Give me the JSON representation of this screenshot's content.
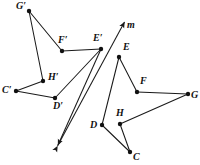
{
  "figure": {
    "type": "geometry-diagram",
    "width": 200,
    "height": 165,
    "background_color": "#ffffff",
    "stroke_color": "#1a1a1a",
    "point_color": "#111111"
  },
  "line_m": {
    "label": "m",
    "label_x": 127,
    "label_y": 20,
    "x1": 57.5,
    "y1": 146,
    "x2": 124.5,
    "y2": 22,
    "arrow_start": true,
    "arrow_end": true
  },
  "ray_ep": {
    "label": "",
    "x1": 101,
    "y1": 49,
    "x2": 58,
    "y2": 145,
    "arrow_end": true
  },
  "points": [
    {
      "id": "G-prime",
      "label": "G′",
      "x": 29,
      "y": 11,
      "label_x": 16,
      "label_y": 1,
      "dot": true
    },
    {
      "id": "F-prime",
      "label": "F′",
      "x": 62,
      "y": 51,
      "label_x": 58,
      "label_y": 35,
      "dot": true
    },
    {
      "id": "E-prime",
      "label": "E′",
      "x": 101,
      "y": 49,
      "label_x": 93,
      "label_y": 33,
      "dot": true
    },
    {
      "id": "H-prime",
      "label": "H′",
      "x": 43,
      "y": 81,
      "label_x": 48,
      "label_y": 72,
      "dot": true
    },
    {
      "id": "C-prime",
      "label": "C′",
      "x": 16,
      "y": 91,
      "label_x": 2,
      "label_y": 85,
      "dot": true
    },
    {
      "id": "D-prime",
      "label": "D′",
      "x": 55,
      "y": 98,
      "label_x": 53,
      "label_y": 101,
      "dot": true
    },
    {
      "id": "E",
      "label": "E",
      "x": 119,
      "y": 57,
      "label_x": 123,
      "label_y": 42,
      "dot": true
    },
    {
      "id": "F",
      "label": "F",
      "x": 137,
      "y": 92,
      "label_x": 140,
      "label_y": 76,
      "dot": true
    },
    {
      "id": "G",
      "label": "G",
      "x": 188,
      "y": 94,
      "label_x": 191,
      "label_y": 90,
      "dot": true
    },
    {
      "id": "H",
      "label": "H",
      "x": 120,
      "y": 124,
      "label_x": 116,
      "label_y": 108,
      "dot": true
    },
    {
      "id": "D",
      "label": "D",
      "x": 102,
      "y": 125,
      "label_x": 90,
      "label_y": 120,
      "dot": true
    },
    {
      "id": "C",
      "label": "C",
      "x": 130,
      "y": 152,
      "label_x": 133,
      "label_y": 152,
      "dot": true
    }
  ],
  "segments_preimage": [
    {
      "id": "E-D",
      "from": "E",
      "to": "D"
    },
    {
      "id": "E-F",
      "from": "E",
      "to": "F"
    },
    {
      "id": "F-G",
      "from": "F",
      "to": "G"
    },
    {
      "id": "G-H",
      "from": "G",
      "to": "H"
    },
    {
      "id": "H-C",
      "from": "H",
      "to": "C"
    },
    {
      "id": "C-D",
      "from": "C",
      "to": "D"
    }
  ],
  "segments_image": [
    {
      "id": "Ep-Dp",
      "from": "E-prime",
      "to": "D-prime"
    },
    {
      "id": "Ep-Fp",
      "from": "E-prime",
      "to": "F-prime"
    },
    {
      "id": "Fp-Gp",
      "from": "F-prime",
      "to": "G-prime"
    },
    {
      "id": "Gp-Hp",
      "from": "G-prime",
      "to": "H-prime"
    },
    {
      "id": "Hp-Cp",
      "from": "H-prime",
      "to": "C-prime"
    },
    {
      "id": "Cp-Dp",
      "from": "C-prime",
      "to": "D-prime"
    }
  ]
}
